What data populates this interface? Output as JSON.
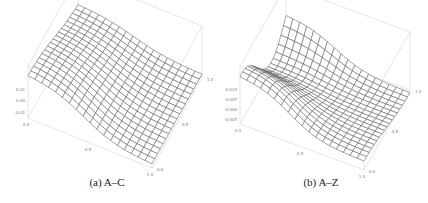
{
  "chart_data": [
    {
      "type": "surface",
      "panel": "a",
      "caption": "(a) A–C",
      "x_range": [
        0.0,
        1.0
      ],
      "y_range": [
        0.0,
        1.0
      ],
      "z_ticks": [
        "0.01",
        "0.00",
        "-0.01"
      ],
      "z_tick_values": [
        0.01,
        0.0,
        -0.01
      ],
      "z_range": [
        -0.015,
        0.03
      ],
      "x_ticks": [
        "0.0",
        "0.5",
        "1.0"
      ],
      "y_ticks": [
        "0.0",
        "0.5",
        "1.0"
      ],
      "grid_lines": 18,
      "shape": "ridge rising toward back-left, sloping down toward front-right",
      "surface_description": "smooth sigmoid-like sheet, highest along far edge, low plateau near front"
    },
    {
      "type": "surface",
      "panel": "b",
      "caption": "(b) A–Z",
      "x_range": [
        0.0,
        1.0
      ],
      "y_range": [
        0.0,
        1.0
      ],
      "z_ticks": [
        "0.014",
        "0.007",
        "0.000",
        "-0.007"
      ],
      "z_tick_values": [
        0.014,
        0.007,
        0.0,
        -0.007
      ],
      "z_range": [
        -0.01,
        0.03
      ],
      "x_ticks": [
        "0.0",
        "0.5",
        "1.0"
      ],
      "y_ticks": [
        "0.0",
        "0.5",
        "1.0"
      ],
      "grid_lines": 18,
      "shape": "saddle-like ridge with a peak at back-left and a dip in the middle",
      "surface_description": "ridge along back-left, trough across middle, low flat region front-right"
    }
  ]
}
